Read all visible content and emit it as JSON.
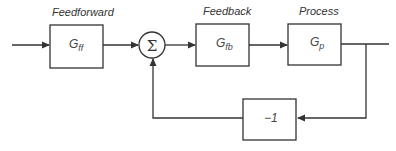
{
  "diagram": {
    "type": "block-diagram",
    "title": "",
    "blocks": [
      {
        "id": "feedforward",
        "header": "Feedforward",
        "symbol": "G",
        "subscript": "ff"
      },
      {
        "id": "feedback",
        "header": "Feedback",
        "symbol": "G",
        "subscript": "fb"
      },
      {
        "id": "process",
        "header": "Process",
        "symbol": "G",
        "subscript": "p"
      },
      {
        "id": "negation",
        "header": "",
        "symbol": "−1",
        "subscript": ""
      }
    ],
    "summing_junction": {
      "symbol": "Σ"
    },
    "connections": [
      "input -> feedforward",
      "feedforward -> summing_junction",
      "summing_junction -> feedback",
      "feedback -> process",
      "process -> output",
      "output -> negation",
      "negation -> summing_junction"
    ],
    "colors": {
      "line": "#333333",
      "background": "#ffffff"
    }
  }
}
